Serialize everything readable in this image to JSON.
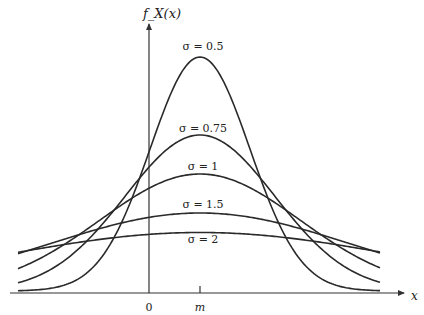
{
  "chart_data": {
    "type": "line",
    "title": "",
    "xlabel": "x",
    "ylabel": "f_X(x)",
    "x_ticks": [
      "0",
      "m"
    ],
    "mean": "m",
    "grid": false,
    "legend": "inline labels above each curve peak",
    "series": [
      {
        "name": "σ = 0.5",
        "sigma": 0.5
      },
      {
        "name": "σ = 0.75",
        "sigma": 0.75
      },
      {
        "name": "σ = 1",
        "sigma": 1
      },
      {
        "name": "σ = 1.5",
        "sigma": 1.5
      },
      {
        "name": "σ = 2",
        "sigma": 2
      }
    ],
    "x_range_relative_to_m": [
      -1.9,
      1.8
    ]
  },
  "labels": {
    "y_axis": "f_X(x)",
    "x_axis": "x",
    "origin": "0",
    "mean": "m",
    "s0": "σ = 0.5",
    "s1": "σ = 0.75",
    "s2": "σ = 1",
    "s3": "σ = 1.5",
    "s4": "σ = 2"
  },
  "colors": {
    "curve": "#2a2a2a",
    "axis": "#333333",
    "background": "#ffffff"
  }
}
